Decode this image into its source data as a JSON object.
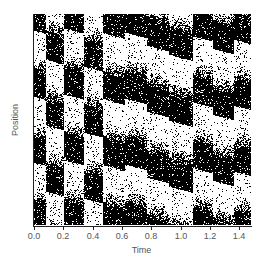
{
  "chart_data": {
    "type": "heatmap",
    "title": "",
    "xlabel": "Time",
    "ylabel": "Position",
    "xlim": [
      0.0,
      1.48
    ],
    "ylim": [
      0,
      1
    ],
    "x_ticks": [
      0.0,
      0.2,
      0.4,
      0.6,
      0.8,
      1.0,
      1.2,
      1.4
    ],
    "x_tick_labels": [
      "0.0",
      "0.2",
      "0.4",
      "0.6",
      "0.8",
      "1.0",
      "1.2",
      "1.4"
    ],
    "y_ticks": [],
    "grid": false,
    "legend": null,
    "colormap": [
      "#ffffff",
      "#000000"
    ],
    "features": {
      "band_period": 0.2,
      "sharp_edge_times": [
        0.0,
        0.08,
        0.2,
        0.34,
        0.47,
        0.62,
        0.77,
        0.92,
        1.08,
        1.22,
        1.36
      ],
      "band_slope_position_per_time": -0.6
    }
  },
  "axes": {
    "xlabel": "Time",
    "ylabel": "Position"
  }
}
